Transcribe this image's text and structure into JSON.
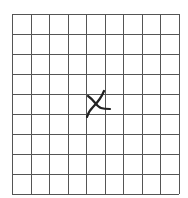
{
  "grid": {
    "columns": 9,
    "rows": 9,
    "left": 12,
    "top": 14,
    "right": 179,
    "bottom": 194,
    "line_color": "#555555",
    "background": "#ffffff"
  },
  "mark": {
    "symbol": "X",
    "cell_column": 5,
    "cell_row": 5,
    "color": "#222222"
  }
}
